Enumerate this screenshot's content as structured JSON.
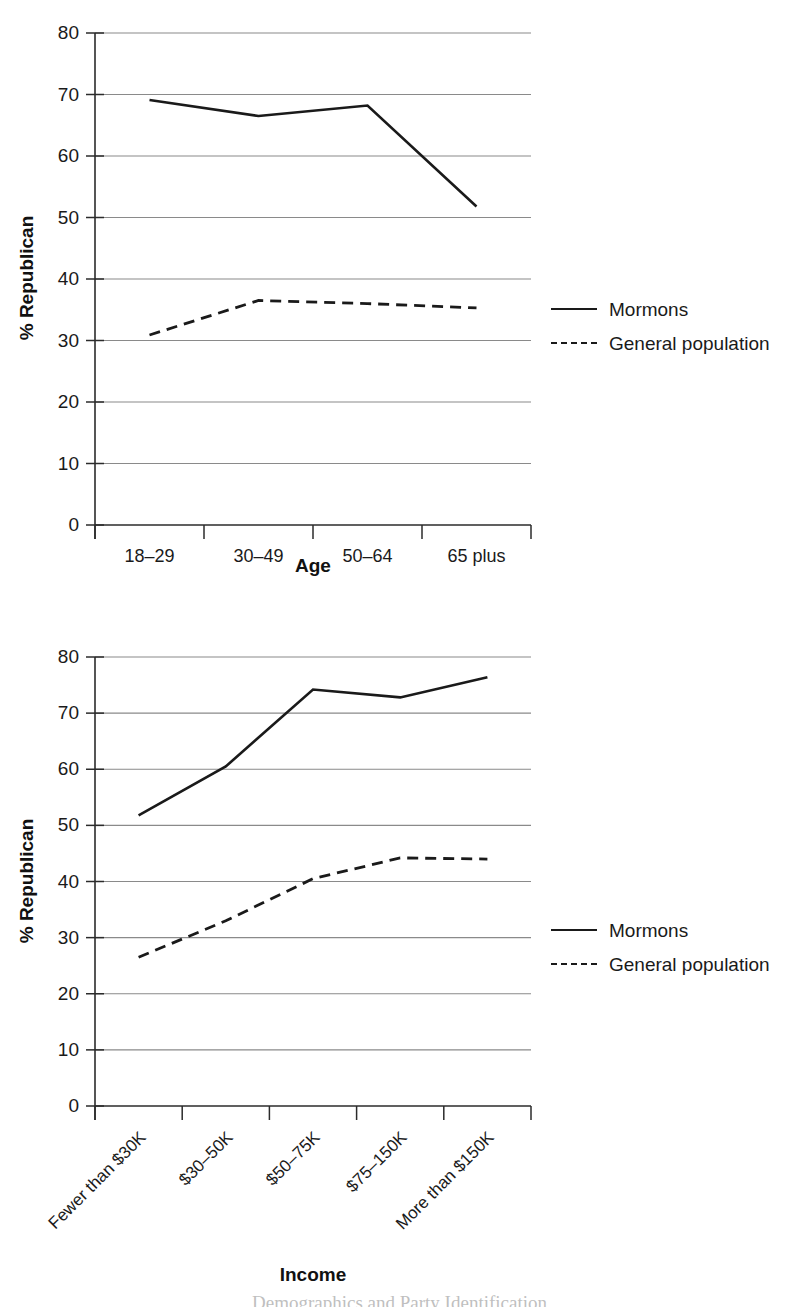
{
  "page": {
    "caption_partial": "Demographics and Party Identification"
  },
  "legend": {
    "series": [
      {
        "name": "Mormons",
        "style": "solid"
      },
      {
        "name": "General population",
        "style": "dashed"
      }
    ]
  },
  "chart_data": [
    {
      "id": "age",
      "type": "line",
      "title": "",
      "xlabel": "Age",
      "ylabel": "% Republican",
      "categories": [
        "18–29",
        "30–49",
        "50–64",
        "65 plus"
      ],
      "yticks": [
        0,
        10,
        20,
        30,
        40,
        50,
        60,
        70,
        80
      ],
      "ylim": [
        0,
        80
      ],
      "grid": true,
      "legend_position": "right",
      "series": [
        {
          "name": "Mormons",
          "style": "solid",
          "values": [
            69.1,
            66.5,
            68.2,
            51.8
          ]
        },
        {
          "name": "General population",
          "style": "dashed",
          "values": [
            30.9,
            36.5,
            36.0,
            35.3
          ]
        }
      ]
    },
    {
      "id": "income",
      "type": "line",
      "title": "",
      "xlabel": "Income",
      "ylabel": "% Republican",
      "categories": [
        "Fewer than $30K",
        "$30–50K",
        "$50–75K",
        "$75–150K",
        "More than $150K"
      ],
      "yticks": [
        0,
        10,
        20,
        30,
        40,
        50,
        60,
        70,
        80
      ],
      "ylim": [
        0,
        80
      ],
      "grid": true,
      "legend_position": "right",
      "series": [
        {
          "name": "Mormons",
          "style": "solid",
          "values": [
            51.8,
            60.5,
            74.2,
            72.8,
            76.4
          ]
        },
        {
          "name": "General population",
          "style": "dashed",
          "values": [
            26.5,
            33.0,
            40.5,
            44.2,
            44.0
          ]
        }
      ]
    }
  ]
}
